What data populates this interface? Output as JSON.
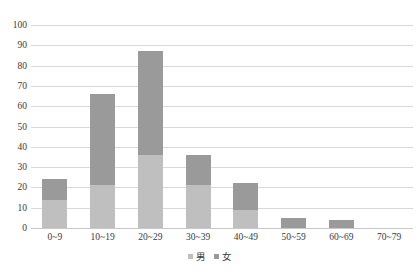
{
  "chart_data": {
    "type": "bar",
    "stacked": true,
    "title": "",
    "subtitle": "",
    "xlabel": "",
    "ylabel": "",
    "categories": [
      "0~9",
      "10~19",
      "20~29",
      "30~39",
      "40~49",
      "50~59",
      "60~69",
      "70~79"
    ],
    "series": [
      {
        "name": "男",
        "color": "#bfbfbf",
        "values": [
          14,
          21,
          36,
          21,
          9,
          0,
          0,
          0
        ]
      },
      {
        "name": "女",
        "color": "#9a9a9a",
        "values": [
          10,
          45,
          51,
          15,
          13,
          5,
          4,
          0
        ]
      }
    ],
    "totals": [
      24,
      66,
      87,
      36,
      22,
      5,
      4,
      0
    ],
    "ylim": [
      0,
      100
    ],
    "ytick_step": 10,
    "yticks": [
      "100",
      "90",
      "80",
      "70",
      "60",
      "50",
      "40",
      "30",
      "20",
      "10",
      "0"
    ],
    "grid": true,
    "grid_color": "#d9d9d9",
    "legend_position": "bottom"
  },
  "legend": {
    "items": [
      {
        "label": "男",
        "swatch": "male-swatch"
      },
      {
        "label": "女",
        "swatch": "female-swatch"
      }
    ]
  }
}
